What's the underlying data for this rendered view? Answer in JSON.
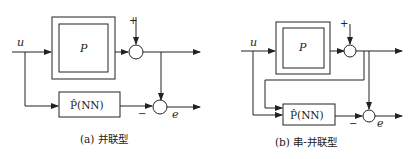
{
  "diagram_a": {
    "input_label": "u",
    "plant_label": "P",
    "model_label": "P̂(NN)",
    "plus_sign": "+",
    "minus_sign": "−",
    "error_label": "e",
    "caption": "(a) 并联型"
  },
  "diagram_b": {
    "input_label": "u",
    "plant_label": "P",
    "model_label": "P̂(NN)",
    "plus_sign": "+",
    "minus_sign": "−",
    "error_label": "e",
    "caption": "(b) 串-并联型"
  }
}
